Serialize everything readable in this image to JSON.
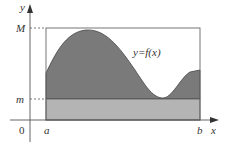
{
  "diagram": {
    "axes": {
      "x_label": "x",
      "y_label": "y",
      "origin_label": "0"
    },
    "x_ticks": {
      "a": "a",
      "b": "b"
    },
    "y_ticks": {
      "M": "M",
      "m": "m"
    },
    "curve_label": "y=f(x)",
    "colors": {
      "curve_fill": "#7a7a7a",
      "lower_rect_fill": "#b4b4b4",
      "axis": "#555555",
      "frame": "#666666",
      "background": "#ffffff"
    }
  }
}
